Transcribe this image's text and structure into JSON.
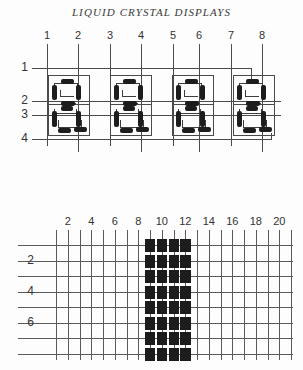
{
  "figure": {
    "title": "LIQUID CRYSTAL DISPLAYS",
    "bottom_caption": ""
  },
  "circuit": {
    "column_labels": [
      "1",
      "2",
      "3",
      "4",
      "5",
      "6",
      "7",
      "8"
    ],
    "column_x": [
      47,
      78,
      110,
      141,
      173,
      199,
      231,
      262
    ],
    "row_labels": [
      "1",
      "2",
      "3",
      "4"
    ],
    "row_label_x": 14,
    "row_y": [
      40,
      73,
      87,
      111
    ],
    "cell_count": 4,
    "cell_x": [
      48,
      110,
      172,
      233
    ],
    "cell_y": 47,
    "cell_w": 42,
    "cell_h": 62,
    "line_color": "#4a4a4a",
    "device_color": "#1d1d1d"
  },
  "chart_data": {
    "type": "heatmap",
    "title": "",
    "xlabel": "",
    "ylabel": "",
    "x_tick_values": [
      1,
      2,
      3,
      4,
      5,
      6,
      7,
      8,
      9,
      10,
      11,
      12,
      13,
      14,
      15,
      16,
      17,
      18,
      19,
      20,
      21
    ],
    "x_labeled_ticks": [
      "2",
      "4",
      "6",
      "8",
      "10",
      "12",
      "14",
      "16",
      "18",
      "20"
    ],
    "x_label_values": [
      2,
      4,
      6,
      8,
      10,
      12,
      14,
      16,
      18,
      20
    ],
    "y_tick_values": [
      1,
      2,
      3,
      4,
      5,
      6,
      7,
      8
    ],
    "y_labeled_ticks": [
      "2",
      "4",
      "6"
    ],
    "y_label_values": [
      2,
      4,
      6
    ],
    "xlim": [
      0,
      21
    ],
    "ylim": [
      0,
      8
    ],
    "grid": true,
    "legend": "none",
    "on_cells_x_range": [
      9,
      12
    ],
    "on_cells_y_range": [
      1,
      8
    ],
    "on_color": "#1c1c1c",
    "grid_color": "#5a5a5a",
    "note": "Dark (activated) rectangular region of pixels spanning columns 9-12 across all rows"
  }
}
